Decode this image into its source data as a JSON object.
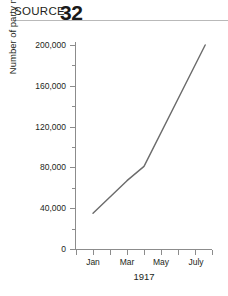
{
  "header": {
    "source_label": "SOURCE",
    "source_number": "32"
  },
  "chart_data": {
    "type": "line",
    "title": "",
    "subtitle": "",
    "xlabel": "1917",
    "ylabel": "Number of party members",
    "grid": false,
    "legend": "none",
    "line_color": "#6b6b6b",
    "axis_color": "#8c8c8c",
    "xlim": [
      0,
      8
    ],
    "ylim": [
      0,
      200000
    ],
    "y_ticks": [
      0,
      40000,
      80000,
      120000,
      160000,
      200000
    ],
    "y_tick_labels": [
      "0",
      "40,000",
      "80,000",
      "120,000",
      "160,000",
      "200,000"
    ],
    "x_tick_labels": [
      "Jan",
      "Mar",
      "May",
      "July"
    ],
    "x_tick_positions": [
      1,
      3,
      5,
      7
    ],
    "x": [
      1,
      3,
      4,
      7.6
    ],
    "values": [
      35000,
      67000,
      81000,
      200000
    ],
    "points": [
      {
        "x_label": "Jan",
        "x": 1,
        "y": 35000
      },
      {
        "x_label": "Feb",
        "x": 3,
        "y": 67000
      },
      {
        "x_label": "Apr",
        "x": 4,
        "y": 81000
      },
      {
        "x_label": "July",
        "x": 7.6,
        "y": 200000
      }
    ]
  }
}
